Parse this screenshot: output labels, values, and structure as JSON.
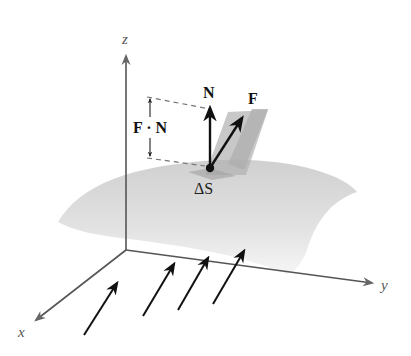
{
  "diagram": {
    "axes": {
      "x_label": "x",
      "y_label": "y",
      "z_label": "z"
    },
    "labels": {
      "normal": "N",
      "field": "F",
      "dot_product": "F · N",
      "area_element": "ΔS"
    },
    "flow_arrows_count": 4,
    "colors": {
      "background": "#ffffff",
      "surface": "#d9d9d9",
      "surface_edge": "#cfcfcf",
      "patch": "#bdbdbd",
      "axis": "#555555",
      "arrow": "#111111",
      "dashed": "#777777"
    }
  }
}
